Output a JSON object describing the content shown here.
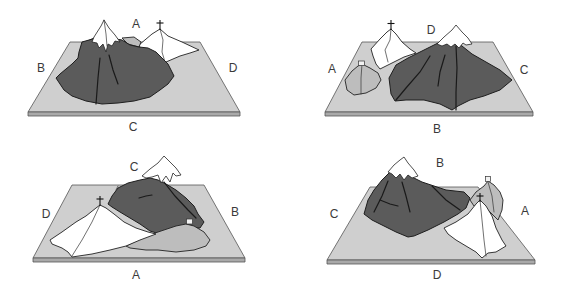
{
  "figure": {
    "colors": {
      "plate_top": "#cfcfcf",
      "plate_edge": "#a9a9a9",
      "dark_mountain": "#5b5b5b",
      "light_mountain": "#ffffff",
      "grey_hill": "#bdbdbd",
      "label_text": "#3a3a3a"
    }
  },
  "panels": [
    {
      "position": "top-left",
      "labels": {
        "top": "A",
        "left": "B",
        "right": "D",
        "bottom": "C"
      }
    },
    {
      "position": "top-right",
      "labels": {
        "top": "D",
        "left": "A",
        "right": "C",
        "bottom": "B"
      }
    },
    {
      "position": "bottom-left",
      "labels": {
        "top": "C",
        "left": "D",
        "right": "B",
        "bottom": "A"
      }
    },
    {
      "position": "bottom-right",
      "labels": {
        "top": "B",
        "left": "C",
        "right": "A",
        "bottom": "D"
      }
    }
  ]
}
